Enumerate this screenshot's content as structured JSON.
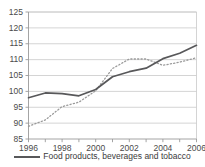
{
  "chart_data": {
    "type": "line",
    "title": "",
    "xlabel": "",
    "ylabel": "",
    "xlim": [
      1996,
      2006
    ],
    "ylim": [
      85,
      125
    ],
    "yticks": [
      85,
      90,
      95,
      100,
      105,
      110,
      115,
      120,
      125
    ],
    "xticks": [
      1996,
      1998,
      2000,
      2002,
      2004,
      2006
    ],
    "xtick_minor_step": 1,
    "grid": "horizontal",
    "legend_position": "bottom-center",
    "x": [
      1996,
      1997,
      1998,
      1999,
      2000,
      2001,
      2002,
      2003,
      2004,
      2005,
      2006
    ],
    "series": [
      {
        "name": "Food products, beverages and tobacco",
        "style": "solid",
        "color": "#58585a",
        "in_legend": true,
        "values": [
          98.0,
          99.5,
          99.3,
          98.6,
          100.6,
          104.6,
          106.2,
          107.3,
          110.3,
          112.0,
          114.5
        ]
      },
      {
        "name": "",
        "style": "dotted",
        "color": "#9a9a9a",
        "in_legend": false,
        "values": [
          89.0,
          91.0,
          95.2,
          96.6,
          100.2,
          107.2,
          110.2,
          110.2,
          108.2,
          109.2,
          110.6
        ]
      }
    ]
  },
  "axis": {
    "ytick_labels": [
      "125",
      "120",
      "115",
      "110",
      "105",
      "100",
      "95",
      "90",
      "85"
    ],
    "xtick_labels": [
      "1996",
      "1998",
      "2000",
      "2002",
      "2004",
      "2006"
    ]
  },
  "legend": {
    "entries": [
      {
        "label": "Food products, beverages and tobacco",
        "marker": "solid-line"
      }
    ]
  },
  "colors": {
    "series_solid": "#58585a",
    "series_dotted": "#9a9a9a",
    "grid": "#c9c9c9",
    "axis": "#9a9a9a",
    "text": "#3a3a3a"
  }
}
